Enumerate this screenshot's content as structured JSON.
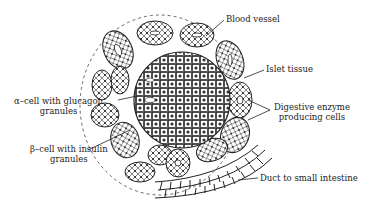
{
  "diagram": {
    "labels": {
      "blood_vessel": "Blood vessel",
      "islet_tissue": "Islet tissue",
      "digestive_line1": "Digestive enzyme",
      "digestive_line2": "producing cells",
      "alpha_line1": "α–cell with glucagon",
      "alpha_line2": "granules",
      "beta_line1": "β–cell with insulin",
      "beta_line2": "granules",
      "duct": "Duct to small intestine"
    }
  }
}
